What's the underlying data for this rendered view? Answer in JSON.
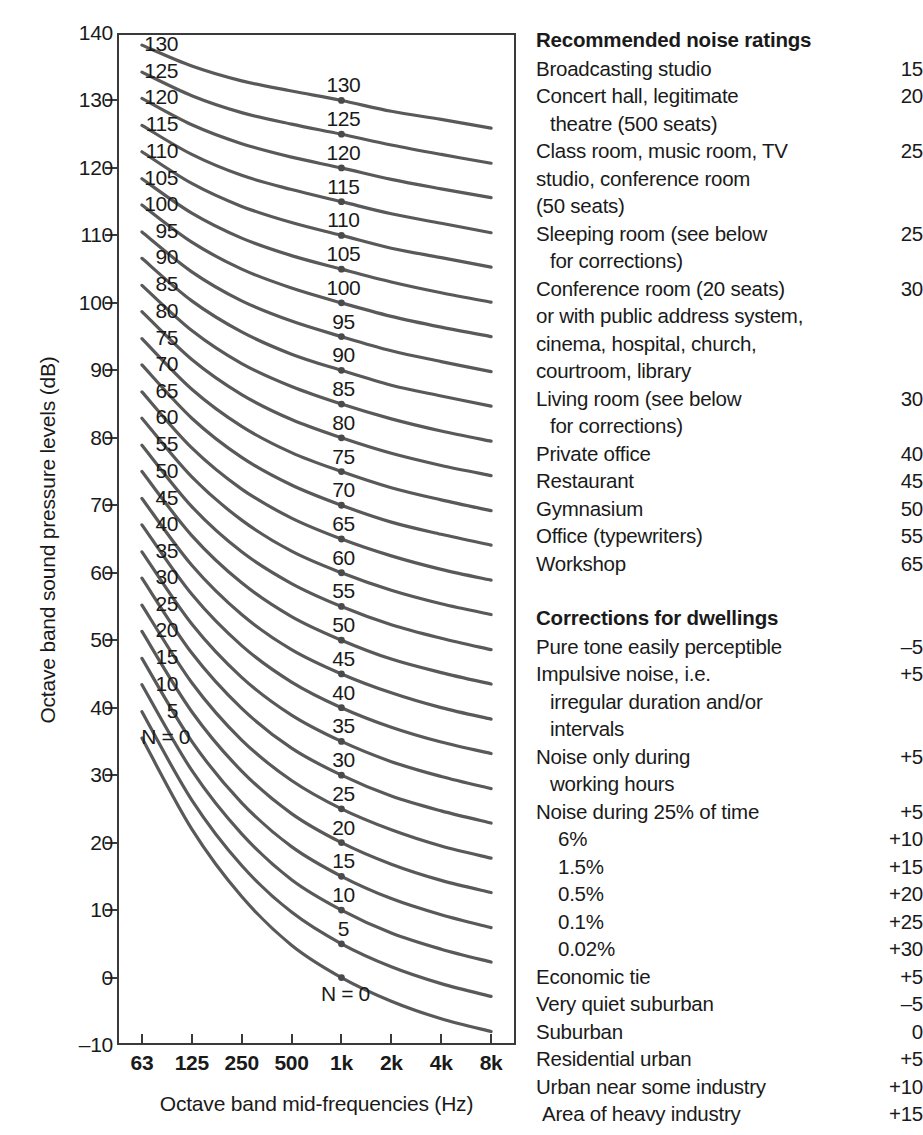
{
  "chart_data": {
    "type": "line",
    "title": "",
    "xlabel": "Octave band mid-frequencies (Hz)",
    "ylabel": "Octave band sound pressure levels (dB)",
    "x_tick_labels": [
      "63",
      "125",
      "250",
      "500",
      "1k",
      "2k",
      "4k",
      "8k"
    ],
    "x_values_hz": [
      63,
      125,
      250,
      500,
      1000,
      2000,
      4000,
      8000
    ],
    "y_tick_labels": [
      "140",
      "130",
      "120",
      "110",
      "100",
      "90",
      "80",
      "70",
      "60",
      "50",
      "40",
      "30",
      "20",
      "10",
      "0",
      "-10"
    ],
    "ylim": [
      -10,
      140
    ],
    "grid": false,
    "legend": "none",
    "curve_label_prefix": "N = 0",
    "marker_frequency_label": "1k",
    "series_note": "ISO Noise Rating (NR) curves, N = 0 to 130 in steps of 5; values are octave band sound pressure level in dB at each octave band mid-frequency.",
    "series": [
      {
        "name": "0",
        "values": [
          35.5,
          22.0,
          12.0,
          4.8,
          0.0,
          -3.5,
          -6.1,
          -8.0
        ]
      },
      {
        "name": "5",
        "values": [
          39.4,
          26.3,
          16.6,
          9.7,
          5.0,
          1.6,
          -0.9,
          -2.8
        ]
      },
      {
        "name": "10",
        "values": [
          43.4,
          30.7,
          21.3,
          14.5,
          10.0,
          6.6,
          4.2,
          2.3
        ]
      },
      {
        "name": "15",
        "values": [
          47.3,
          35.0,
          25.9,
          19.4,
          15.0,
          11.7,
          9.3,
          7.4
        ]
      },
      {
        "name": "20",
        "values": [
          51.3,
          39.4,
          30.6,
          24.3,
          20.0,
          16.8,
          14.4,
          12.6
        ]
      },
      {
        "name": "25",
        "values": [
          55.2,
          43.7,
          35.2,
          29.2,
          25.0,
          21.9,
          19.5,
          17.7
        ]
      },
      {
        "name": "30",
        "values": [
          59.2,
          48.1,
          39.9,
          34.0,
          30.0,
          26.9,
          24.7,
          22.9
        ]
      },
      {
        "name": "35",
        "values": [
          63.1,
          52.4,
          44.5,
          38.9,
          35.0,
          32.0,
          29.8,
          28.0
        ]
      },
      {
        "name": "40",
        "values": [
          67.1,
          56.8,
          49.2,
          43.8,
          40.0,
          37.1,
          34.9,
          33.2
        ]
      },
      {
        "name": "45",
        "values": [
          71.0,
          61.1,
          53.8,
          48.6,
          45.0,
          42.2,
          40.0,
          38.3
        ]
      },
      {
        "name": "50",
        "values": [
          75.0,
          65.5,
          58.5,
          53.5,
          50.0,
          47.2,
          45.2,
          43.5
        ]
      },
      {
        "name": "55",
        "values": [
          78.9,
          69.8,
          63.1,
          58.4,
          55.0,
          52.3,
          50.3,
          48.6
        ]
      },
      {
        "name": "60",
        "values": [
          82.9,
          74.2,
          67.8,
          63.2,
          60.0,
          57.4,
          55.4,
          53.8
        ]
      },
      {
        "name": "65",
        "values": [
          86.8,
          78.5,
          72.4,
          68.1,
          65.0,
          62.5,
          60.5,
          58.9
        ]
      },
      {
        "name": "70",
        "values": [
          90.8,
          82.9,
          77.1,
          73.0,
          70.0,
          67.5,
          65.7,
          64.1
        ]
      },
      {
        "name": "75",
        "values": [
          94.7,
          87.2,
          81.7,
          77.8,
          75.0,
          72.6,
          70.8,
          69.2
        ]
      },
      {
        "name": "80",
        "values": [
          98.7,
          91.6,
          86.4,
          82.7,
          80.0,
          77.7,
          75.9,
          74.4
        ]
      },
      {
        "name": "85",
        "values": [
          102.6,
          95.9,
          91.0,
          87.6,
          85.0,
          82.8,
          81.0,
          79.5
        ]
      },
      {
        "name": "90",
        "values": [
          106.6,
          100.3,
          95.7,
          92.4,
          90.0,
          87.8,
          86.2,
          84.7
        ]
      },
      {
        "name": "95",
        "values": [
          110.5,
          104.6,
          100.3,
          97.3,
          95.0,
          92.9,
          91.3,
          89.8
        ]
      },
      {
        "name": "100",
        "values": [
          114.5,
          109.0,
          105.0,
          102.2,
          100.0,
          98.0,
          96.4,
          95.0
        ]
      },
      {
        "name": "105",
        "values": [
          118.4,
          113.3,
          109.6,
          107.0,
          105.0,
          103.1,
          101.5,
          100.1
        ]
      },
      {
        "name": "110",
        "values": [
          122.4,
          117.7,
          114.3,
          111.9,
          110.0,
          108.1,
          106.7,
          105.3
        ]
      },
      {
        "name": "115",
        "values": [
          126.3,
          122.0,
          118.9,
          116.8,
          115.0,
          113.2,
          111.8,
          110.4
        ]
      },
      {
        "name": "120",
        "values": [
          130.3,
          126.4,
          123.6,
          121.6,
          120.0,
          118.3,
          116.9,
          115.6
        ]
      },
      {
        "name": "125",
        "values": [
          134.2,
          130.7,
          128.2,
          126.5,
          125.0,
          123.4,
          122.0,
          120.7
        ]
      },
      {
        "name": "130",
        "values": [
          138.2,
          135.1,
          132.9,
          131.4,
          130.0,
          128.4,
          127.2,
          125.9
        ]
      }
    ],
    "left_labels": [
      "130",
      "125",
      "120",
      "115",
      "110",
      "105",
      "100",
      "95",
      "90",
      "85",
      "80",
      "75",
      "70",
      "65",
      "60",
      "55",
      "50",
      "45",
      "40",
      "35",
      "30",
      "25",
      "20",
      "15",
      "10",
      "5",
      "N = 0"
    ],
    "mid_labels": [
      "130",
      "125",
      "120",
      "115",
      "110",
      "105",
      "100",
      "95",
      "90",
      "85",
      "80",
      "75",
      "70",
      "65",
      "60",
      "55",
      "50",
      "45",
      "40",
      "35",
      "30",
      "25",
      "20",
      "15",
      "10",
      "5",
      "N = 0"
    ]
  },
  "table": {
    "section1": {
      "heading": "Recommended noise ratings",
      "rows": [
        {
          "text": "Broadcasting studio",
          "value": "15",
          "indent": 0
        },
        {
          "text": "Concert hall, legitimate",
          "value": "20",
          "indent": 0
        },
        {
          "text": "theatre (500 seats)",
          "value": "",
          "indent": 1
        },
        {
          "text": "Class room, music room, TV",
          "value": "25",
          "indent": 0
        },
        {
          "text": "studio, conference room",
          "value": "",
          "indent": 0
        },
        {
          "text": "(50 seats)",
          "value": "",
          "indent": 0
        },
        {
          "text": "Sleeping room (see below",
          "value": "25",
          "indent": 0
        },
        {
          "text": "for corrections)",
          "value": "",
          "indent": 1
        },
        {
          "text": "Conference room (20 seats)",
          "value": "30",
          "indent": 0
        },
        {
          "text": "or with public address system,",
          "value": "",
          "indent": 0
        },
        {
          "text": "cinema, hospital, church,",
          "value": "",
          "indent": 0
        },
        {
          "text": "courtroom, library",
          "value": "",
          "indent": 0
        },
        {
          "text": "Living room (see below",
          "value": "30",
          "indent": 0
        },
        {
          "text": "for corrections)",
          "value": "",
          "indent": 1
        },
        {
          "text": "Private office",
          "value": "40",
          "indent": 0
        },
        {
          "text": "Restaurant",
          "value": "45",
          "indent": 0
        },
        {
          "text": "Gymnasium",
          "value": "50",
          "indent": 0
        },
        {
          "text": "Office (typewriters)",
          "value": "55",
          "indent": 0
        },
        {
          "text": "Workshop",
          "value": "65",
          "indent": 0
        }
      ]
    },
    "section2": {
      "heading": "Corrections for dwellings",
      "rows": [
        {
          "text": "Pure tone easily perceptible",
          "value": "–5",
          "indent": 0
        },
        {
          "text": "Impulsive noise, i.e.",
          "value": "+5",
          "indent": 0
        },
        {
          "text": "irregular duration and/or",
          "value": "",
          "indent": 1
        },
        {
          "text": "intervals",
          "value": "",
          "indent": 1
        },
        {
          "text": "Noise only during",
          "value": "+5",
          "indent": 0
        },
        {
          "text": "working hours",
          "value": "",
          "indent": 1
        },
        {
          "text": "Noise during 25% of time",
          "value": "+5",
          "indent": 0
        },
        {
          "text": "6%",
          "value": "+10",
          "indent": 2
        },
        {
          "text": "1.5%",
          "value": "+15",
          "indent": 2
        },
        {
          "text": "0.5%",
          "value": "+20",
          "indent": 2
        },
        {
          "text": "0.1%",
          "value": "+25",
          "indent": 2
        },
        {
          "text": "0.02%",
          "value": "+30",
          "indent": 2
        },
        {
          "text": "Economic tie",
          "value": "+5",
          "indent": 0
        },
        {
          "text": "Very quiet suburban",
          "value": "–5",
          "indent": 0
        },
        {
          "text": "Suburban",
          "value": "0",
          "indent": 0
        },
        {
          "text": "Residential urban",
          "value": "+5",
          "indent": 0
        },
        {
          "text": "Urban near some industry",
          "value": "+10",
          "indent": 0
        },
        {
          "text": "Area of heavy industry",
          "value": "+15",
          "indent": 3
        }
      ]
    }
  },
  "colors": {
    "curve": "#595959",
    "frame": "#3a3a3a",
    "text": "#1a1a1a"
  }
}
